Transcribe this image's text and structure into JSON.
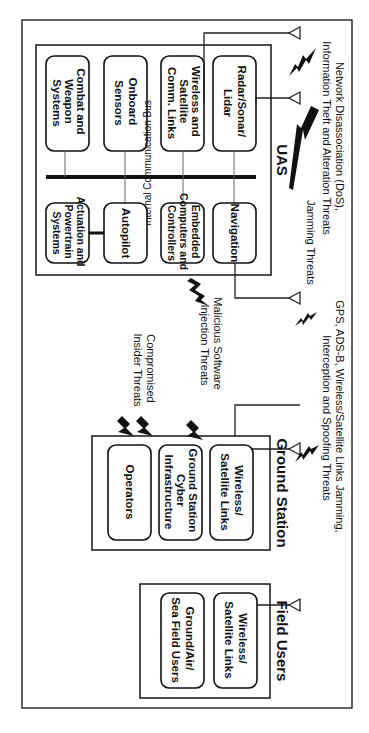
{
  "diagram": {
    "orientation": "rotated 90 degrees clockwise",
    "uas": {
      "title": "UAS",
      "bus_label": "Internal Communication Bus",
      "top_row": [
        {
          "label_lines": [
            "Radar/Sonar/",
            "Lidar"
          ]
        },
        {
          "label_lines": [
            "Wireless and",
            "Satellite",
            "Comm. Links"
          ]
        },
        {
          "label_lines": [
            "Onboard",
            "Sensors"
          ]
        },
        {
          "label_lines": [
            "Combat and",
            "Weapon",
            "Systems"
          ]
        }
      ],
      "bottom_row": [
        {
          "label_lines": [
            "Navigation"
          ]
        },
        {
          "label_lines": [
            "Embedded",
            "Computers and",
            "Controllers"
          ]
        },
        {
          "label_lines": [
            "Autopilot"
          ]
        },
        {
          "label_lines": [
            "Actuation and",
            "Powertrain",
            "Systems"
          ]
        }
      ]
    },
    "ground_station": {
      "title": "Ground Station",
      "boxes": [
        {
          "label_lines": [
            "Wireless/",
            "Satellite Links"
          ]
        },
        {
          "label_lines": [
            "Ground Station",
            "Cyber",
            "Infrastructure"
          ]
        },
        {
          "label_lines": [
            "Operators"
          ]
        }
      ]
    },
    "field_users": {
      "title": "Field Users",
      "boxes": [
        {
          "label_lines": [
            "Wireless/",
            "Satellite Links"
          ]
        },
        {
          "label_lines": [
            "Ground/Air/",
            "Sea Field Users"
          ]
        }
      ]
    },
    "threats": {
      "network": [
        "Network Disassociation (DoS),",
        "Information Theft and Alteration Threats"
      ],
      "jamming": [
        "Jamming Threats"
      ],
      "gps": [
        "GPS, ADS-B, Wireless/Satellite Links Jamming,",
        "Interception and Spoofing Threats"
      ],
      "malicious": [
        "Malicious Software",
        "Injection Threats"
      ],
      "insider": [
        "Compromised",
        "Insider Threats"
      ]
    }
  }
}
